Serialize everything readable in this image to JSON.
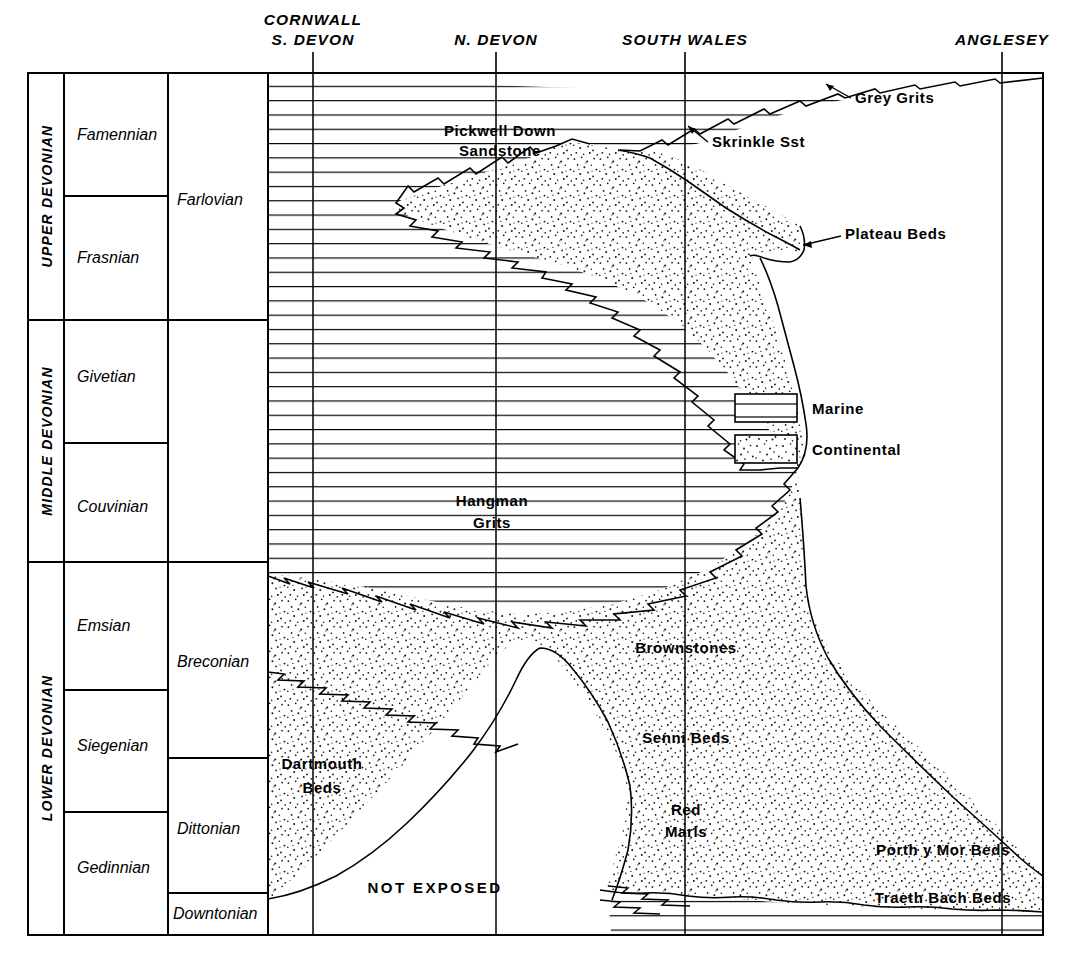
{
  "figure": {
    "kind": "stratigraphic-correlation-chart"
  },
  "locality_headers": [
    {
      "id": "cornwall-s-devon",
      "lines": [
        "CORNWALL",
        "S. DEVON"
      ],
      "x": 313
    },
    {
      "id": "n-devon",
      "lines": [
        "N. DEVON"
      ],
      "x": 496
    },
    {
      "id": "south-wales",
      "lines": [
        "SOUTH  WALES"
      ],
      "x": 685
    },
    {
      "id": "anglesey",
      "lines": [
        "ANGLESEY"
      ],
      "x": 1002
    }
  ],
  "systems": [
    {
      "id": "upper-devonian",
      "label": "UPPER  DEVONIAN",
      "y0": 73,
      "y1": 320
    },
    {
      "id": "middle-devonian",
      "label": "MIDDLE  DEVONIAN",
      "y0": 320,
      "y1": 562
    },
    {
      "id": "lower-devonian",
      "label": "LOWER  DEVONIAN",
      "y0": 562,
      "y1": 935
    }
  ],
  "stages": [
    {
      "id": "famennian",
      "label": "Famennian",
      "y0": 73,
      "y1": 196
    },
    {
      "id": "frasnian",
      "label": "Frasnian",
      "y0": 196,
      "y1": 320
    },
    {
      "id": "givetian",
      "label": "Givetian",
      "y0": 320,
      "y1": 443
    },
    {
      "id": "couvinian",
      "label": "Couvinian",
      "y0": 443,
      "y1": 562
    },
    {
      "id": "emsian",
      "label": "Emsian",
      "y0": 562,
      "y1": 690
    },
    {
      "id": "siegenian",
      "label": "Siegenian",
      "y0": 690,
      "y1": 812
    },
    {
      "id": "gedinnian",
      "label": "Gedinnian",
      "y0": 812,
      "y1": 935
    }
  ],
  "series": [
    {
      "id": "farlovian",
      "label": "Farlovian",
      "y0": 73,
      "y1": 320
    },
    {
      "id": "breconian",
      "label": "Breconian",
      "y0": 320,
      "y1": 758
    },
    {
      "id": "dittonian",
      "label": "Dittonian",
      "y0": 758,
      "y1": 893
    },
    {
      "id": "downtonian",
      "label": "Downtonian",
      "y0": 893,
      "y1": 935
    }
  ],
  "formations": [
    {
      "id": "grey-grits",
      "label": "Grey Grits",
      "x": 855,
      "y": 103,
      "anchor": "start",
      "leader": true
    },
    {
      "id": "pickwell-down-sandstone",
      "label_lines": [
        "Pickwell Down",
        "Sandstone"
      ],
      "x": 500,
      "y": 136,
      "anchor": "middle",
      "leader": false
    },
    {
      "id": "skrinkle-sst",
      "label": "Skrinkle Sst",
      "x": 712,
      "y": 147,
      "anchor": "start",
      "leader": true
    },
    {
      "id": "plateau-beds",
      "label": "Plateau  Beds",
      "x": 845,
      "y": 239,
      "anchor": "start",
      "leader": true
    },
    {
      "id": "hangman-grits",
      "label_lines": [
        "Hangman",
        "Grits"
      ],
      "x": 492,
      "y": 506,
      "anchor": "middle",
      "leader": false
    },
    {
      "id": "brownstones",
      "label": "Brownstones",
      "x": 686,
      "y": 653,
      "anchor": "middle",
      "leader": false
    },
    {
      "id": "senni-beds",
      "label": "Senni Beds",
      "x": 686,
      "y": 743,
      "anchor": "middle",
      "leader": false
    },
    {
      "id": "red-marls",
      "label_lines": [
        "Red",
        "Marls"
      ],
      "x": 686,
      "y": 815,
      "anchor": "middle",
      "leader": false
    },
    {
      "id": "dartmouth-beds",
      "label_lines": [
        "Dartmouth",
        "Beds"
      ],
      "x": 322,
      "y": 769,
      "anchor": "middle",
      "leader": false
    },
    {
      "id": "porth-y-mor-beds",
      "label": "Porth y Mor Beds",
      "x": 943,
      "y": 855,
      "anchor": "middle",
      "leader": false
    },
    {
      "id": "traeth-bach-beds",
      "label": "Traeth Bach Beds",
      "x": 943,
      "y": 903,
      "anchor": "middle",
      "leader": false
    },
    {
      "id": "not-exposed",
      "label": "NOT  EXPOSED",
      "x": 435,
      "y": 893,
      "anchor": "middle",
      "leader": false
    }
  ],
  "legend": {
    "items": [
      {
        "id": "marine",
        "label": "Marine",
        "pattern": "horizontal-lines"
      },
      {
        "id": "continental",
        "label": "Continental",
        "pattern": "stipple"
      }
    ]
  },
  "colors": {
    "ink": "#000000",
    "paper": "#ffffff"
  }
}
